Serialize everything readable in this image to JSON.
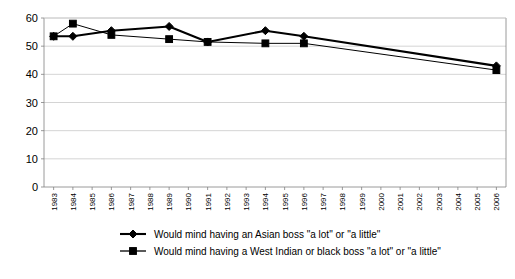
{
  "chart_data": {
    "type": "line",
    "title": "",
    "xlabel": "",
    "ylabel": "",
    "ylim": [
      0,
      60
    ],
    "ytick_step": 10,
    "yticks": [
      "0",
      "10",
      "20",
      "30",
      "40",
      "50",
      "60"
    ],
    "grid": true,
    "legend_position": "bottom-left",
    "categories": [
      "1983",
      "1984",
      "1985",
      "1986",
      "1987",
      "1988",
      "1989",
      "1990",
      "1991",
      "1992",
      "1993",
      "1994",
      "1995",
      "1996",
      "1997",
      "1998",
      "1999",
      "2000",
      "2001",
      "2002",
      "2003",
      "2004",
      "2005",
      "2006"
    ],
    "data_years": [
      "1983",
      "1984",
      "1986",
      "1989",
      "1991",
      "1994",
      "1996",
      "2006"
    ],
    "series": [
      {
        "name": "Would mind having an Asian boss \"a lot\" or \"a little\"",
        "marker": "diamond",
        "color": "#000000",
        "x": [
          "1983",
          "1984",
          "1986",
          "1989",
          "1991",
          "1994",
          "1996",
          "2006"
        ],
        "values": [
          53.5,
          53.5,
          55.5,
          57,
          51.5,
          55.5,
          53.5,
          43
        ]
      },
      {
        "name": "Would mind having a West Indian or black boss \"a lot\" or \"a little\"",
        "marker": "square",
        "color": "#000000",
        "x": [
          "1983",
          "1984",
          "1986",
          "1989",
          "1991",
          "1994",
          "1996",
          "2006"
        ],
        "values": [
          53.5,
          58,
          54,
          52.5,
          51.5,
          51,
          51,
          41.5
        ]
      }
    ]
  },
  "legend": {
    "items": [
      {
        "label": "Would mind having an Asian boss \"a lot\" or \"a little\"",
        "marker": "diamond-marker-icon"
      },
      {
        "label": "Would mind having a West Indian or black boss \"a lot\" or \"a little\"",
        "marker": "square-marker-icon"
      }
    ]
  }
}
